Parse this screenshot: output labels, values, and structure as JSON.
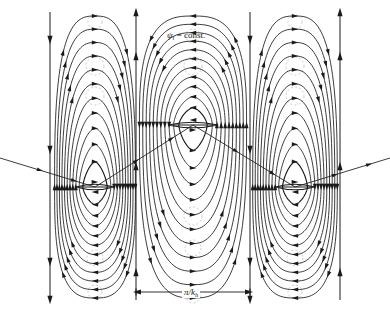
{
  "figure": {
    "type": "streamline-contour-plot",
    "background_color": "#ffffff",
    "line_color": "#1a1a1a",
    "faint_color": "#b9b9b9"
  },
  "annotations": {
    "psi_label": {
      "symbol": "ψ",
      "subscript": "i",
      "equals": " = const.",
      "x": 167,
      "y": 30
    },
    "dimension_label": {
      "text_numer": "π/",
      "symbol": "k",
      "subscript": "h",
      "x": 182,
      "y": 287
    }
  },
  "scale_bar": {
    "y": 292,
    "x_start": 136,
    "x_end": 250,
    "arrow_left": "left-arrowhead",
    "arrow_right": "right-arrowhead",
    "tick_height": 7
  },
  "chart_data": {
    "type": "line",
    "title": "",
    "xlabel": "",
    "ylabel": "",
    "grid": false,
    "legend": "none",
    "xlim": [
      0,
      390
    ],
    "ylim": [
      0,
      315
    ],
    "boundary_lines": [
      {
        "x": 50,
        "y0": 12,
        "y1": 300,
        "arrow_dir": "down",
        "arrows_at": [
          40,
          150,
          262
        ]
      },
      {
        "x": 136,
        "y0": 12,
        "y1": 300,
        "arrow_dir": "up",
        "arrows_at": [
          56,
          166,
          272
        ]
      },
      {
        "x": 250,
        "y0": 12,
        "y1": 300,
        "arrow_dir": "down",
        "arrows_at": [
          40,
          150,
          262
        ]
      },
      {
        "x": 340,
        "y0": 12,
        "y1": 300,
        "arrow_dir": "up",
        "arrows_at": [
          56,
          166,
          272
        ]
      }
    ],
    "cells": [
      {
        "name": "left-cell",
        "cx": 95,
        "cy": 187,
        "x_left": 50,
        "x_right": 136,
        "rotation": "clockwise",
        "n_contours": 11
      },
      {
        "name": "middle-cell",
        "cx": 193,
        "cy": 125,
        "x_left": 136,
        "x_right": 250,
        "rotation": "counterclockwise",
        "n_contours": 11
      },
      {
        "name": "right-cell",
        "cx": 295,
        "cy": 187,
        "x_left": 250,
        "x_right": 340,
        "rotation": "clockwise",
        "n_contours": 11
      }
    ],
    "separatrix_points": [
      {
        "x": 0,
        "y": 158
      },
      {
        "x": 95,
        "y": 187
      },
      {
        "x": 193,
        "y": 125
      },
      {
        "x": 295,
        "y": 187
      },
      {
        "x": 390,
        "y": 158
      }
    ],
    "faint_circles": [
      {
        "cx": 95,
        "cy": 22,
        "r": 7
      },
      {
        "cx": 95,
        "cy": 66,
        "r": 9
      },
      {
        "cx": 95,
        "cy": 96,
        "r": 9
      },
      {
        "cx": 95,
        "cy": 258,
        "r": 8
      },
      {
        "cx": 95,
        "cy": 292,
        "r": 7
      },
      {
        "cx": 193,
        "cy": 36,
        "r": 7
      },
      {
        "cx": 193,
        "cy": 66,
        "r": 9
      },
      {
        "cx": 193,
        "cy": 216,
        "r": 9
      },
      {
        "cx": 193,
        "cy": 248,
        "r": 8
      },
      {
        "cx": 193,
        "cy": 296,
        "r": 7
      },
      {
        "cx": 295,
        "cy": 22,
        "r": 7
      },
      {
        "cx": 295,
        "cy": 66,
        "r": 9
      },
      {
        "cx": 295,
        "cy": 96,
        "r": 9
      },
      {
        "cx": 295,
        "cy": 258,
        "r": 8
      },
      {
        "cx": 295,
        "cy": 292,
        "r": 7
      }
    ]
  }
}
